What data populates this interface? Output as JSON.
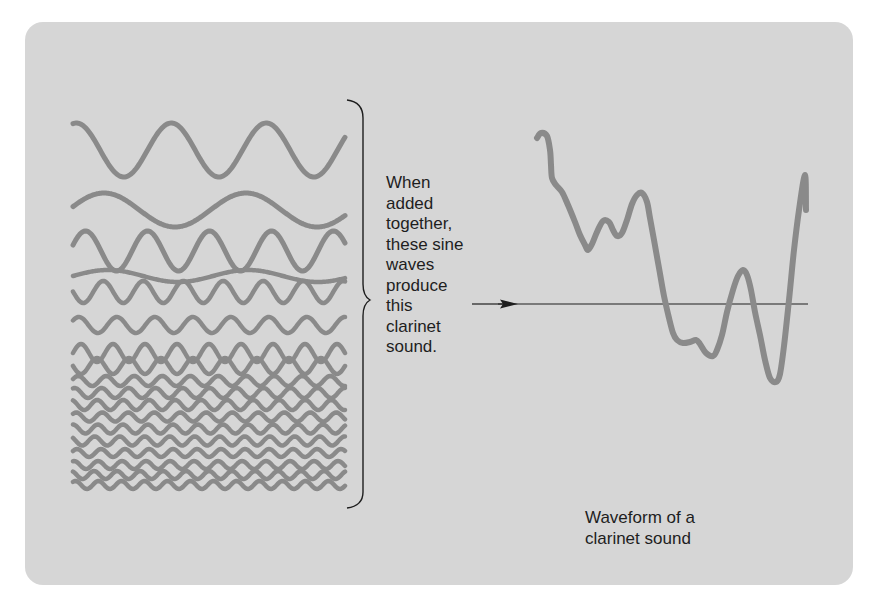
{
  "figure": {
    "background_color": "#d6d6d6",
    "wave_color": "#8a8a8a",
    "line_color": "#1e1e1e"
  },
  "component_waves": {
    "label": "Sine wave components",
    "rows": [
      {
        "y": 150,
        "amp": 27,
        "wavelength": 95,
        "phase": 1.35
      },
      {
        "y": 210,
        "amp": 17,
        "wavelength": 142,
        "phase": 0.2
      },
      {
        "y": 251,
        "amp": 20,
        "wavelength": 62,
        "phase": 0.3
      },
      {
        "y": 276,
        "amp": 6,
        "wavelength": 140,
        "phase": 0.0
      },
      {
        "y": 292,
        "amp": 11,
        "wavelength": 40,
        "phase": 3.1
      },
      {
        "y": 325,
        "amp": 8,
        "wavelength": 38,
        "phase": 0.6
      },
      {
        "y": 353,
        "amp": 9,
        "wavelength": 32,
        "phase": 0.0
      },
      {
        "y": 366,
        "amp": 8,
        "wavelength": 32,
        "phase": 3.14
      },
      {
        "y": 381,
        "amp": 5,
        "wavelength": 28,
        "phase": 0.4
      },
      {
        "y": 393,
        "amp": 5,
        "wavelength": 27,
        "phase": 1.2
      },
      {
        "y": 405,
        "amp": 5,
        "wavelength": 26,
        "phase": 2.0
      },
      {
        "y": 417,
        "amp": 4.5,
        "wavelength": 26,
        "phase": 0.8
      },
      {
        "y": 429,
        "amp": 4.5,
        "wavelength": 25,
        "phase": 1.6
      },
      {
        "y": 441,
        "amp": 4.5,
        "wavelength": 25,
        "phase": 2.4
      },
      {
        "y": 453,
        "amp": 4,
        "wavelength": 24,
        "phase": 0.5
      },
      {
        "y": 465,
        "amp": 4,
        "wavelength": 24,
        "phase": 1.3
      },
      {
        "y": 475,
        "amp": 4,
        "wavelength": 23,
        "phase": 2.1
      },
      {
        "y": 485,
        "amp": 4,
        "wavelength": 23,
        "phase": 0.9
      }
    ],
    "x_start": 73,
    "x_end": 345
  },
  "brace_label": {
    "lines": [
      "When",
      "added",
      "together,",
      "these sine",
      "waves",
      "produce",
      "this",
      "clarinet",
      "sound."
    ]
  },
  "waveform": {
    "points": [
      [
        537,
        138
      ],
      [
        541,
        133
      ],
      [
        547,
        136
      ],
      [
        550,
        150
      ],
      [
        551,
        165
      ],
      [
        552,
        178
      ],
      [
        556,
        185
      ],
      [
        562,
        192
      ],
      [
        568,
        205
      ],
      [
        575,
        222
      ],
      [
        580,
        235
      ],
      [
        585,
        245
      ],
      [
        588,
        250
      ],
      [
        592,
        244
      ],
      [
        597,
        232
      ],
      [
        603,
        221
      ],
      [
        609,
        222
      ],
      [
        613,
        230
      ],
      [
        617,
        236
      ],
      [
        622,
        233
      ],
      [
        627,
        220
      ],
      [
        632,
        204
      ],
      [
        637,
        195
      ],
      [
        642,
        193
      ],
      [
        647,
        202
      ],
      [
        650,
        218
      ],
      [
        654,
        240
      ],
      [
        659,
        268
      ],
      [
        664,
        296
      ],
      [
        669,
        318
      ],
      [
        673,
        333
      ],
      [
        677,
        340
      ],
      [
        683,
        343
      ],
      [
        690,
        342
      ],
      [
        696,
        340
      ],
      [
        700,
        344
      ],
      [
        706,
        353
      ],
      [
        713,
        356
      ],
      [
        717,
        350
      ],
      [
        722,
        335
      ],
      [
        727,
        312
      ],
      [
        733,
        290
      ],
      [
        738,
        276
      ],
      [
        743,
        270
      ],
      [
        747,
        275
      ],
      [
        751,
        290
      ],
      [
        755,
        312
      ],
      [
        760,
        335
      ],
      [
        765,
        360
      ],
      [
        770,
        378
      ],
      [
        776,
        382
      ],
      [
        780,
        374
      ],
      [
        784,
        346
      ],
      [
        789,
        300
      ],
      [
        794,
        250
      ],
      [
        799,
        210
      ],
      [
        805,
        175
      ],
      [
        806,
        210
      ]
    ],
    "axis_y": 304,
    "axis_x_start": 498,
    "axis_x_end": 808
  },
  "waveform_caption": {
    "lines": [
      "Waveform of a",
      "clarinet sound"
    ]
  }
}
